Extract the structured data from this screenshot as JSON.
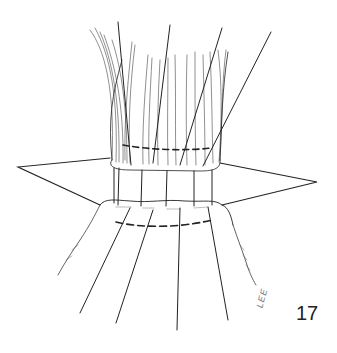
{
  "figure": {
    "number": "17",
    "signature": "LEE",
    "colors": {
      "line": "#222222",
      "hatch": "#555555",
      "background": "#ffffff"
    }
  }
}
